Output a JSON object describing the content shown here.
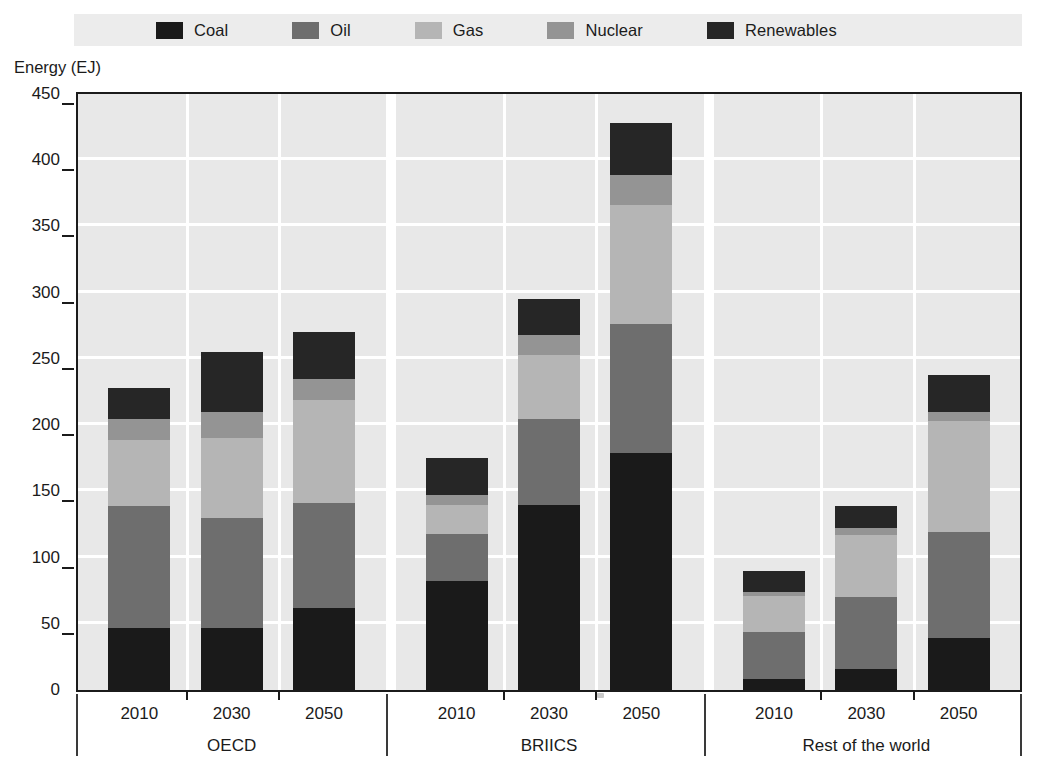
{
  "legend": {
    "position": "top",
    "items": [
      {
        "label": "Coal",
        "color": "#1a1a1a",
        "icon": "legend-swatch-icon"
      },
      {
        "label": "Oil",
        "color": "#6e6e6e",
        "icon": "legend-swatch-icon"
      },
      {
        "label": "Gas",
        "color": "#b5b5b5",
        "icon": "legend-swatch-icon"
      },
      {
        "label": "Nuclear",
        "color": "#949494",
        "icon": "legend-swatch-icon"
      },
      {
        "label": "Renewables",
        "color": "#262626",
        "icon": "legend-swatch-icon"
      }
    ]
  },
  "axes": {
    "ylabel": "Energy (EJ)",
    "yticks": [
      "0",
      "50",
      "100",
      "150",
      "200",
      "250",
      "300",
      "350",
      "400",
      "450"
    ],
    "ymin": 0,
    "ymax": 450,
    "ystep": 50
  },
  "groups": [
    {
      "name": "OECD",
      "years": [
        "2010",
        "2030",
        "2050"
      ]
    },
    {
      "name": "BRIICS",
      "years": [
        "2010",
        "2030",
        "2050"
      ]
    },
    {
      "name": "Rest of the world",
      "years": [
        "2010",
        "2030",
        "2050"
      ]
    }
  ],
  "colors": {
    "plot_background": "#e8e8e8",
    "gridline": "#ffffff",
    "legend_background": "#ececec",
    "axis": "#1b1b1b",
    "page_background": "#ffffff"
  },
  "chart_data": {
    "type": "bar",
    "subtype": "stacked",
    "title": "",
    "xlabel": "",
    "ylabel": "Energy (EJ)",
    "ylim": [
      0,
      450
    ],
    "ytick_step": 50,
    "grid": true,
    "legend_position": "top",
    "categories": [
      "OECD 2010",
      "OECD 2030",
      "OECD 2050",
      "BRIICS 2010",
      "BRIICS 2030",
      "BRIICS 2050",
      "Rest of the world 2010",
      "Rest of the world 2030",
      "Rest of the world 2050"
    ],
    "group_names": [
      "OECD",
      "BRIICS",
      "Rest of the world"
    ],
    "years": [
      "2010",
      "2030",
      "2050"
    ],
    "series": [
      {
        "name": "Coal",
        "color": "#1a1a1a",
        "values": [
          47,
          47,
          62,
          82,
          140,
          179,
          8,
          16,
          39
        ]
      },
      {
        "name": "Oil",
        "color": "#6e6e6e",
        "values": [
          92,
          83,
          79,
          36,
          65,
          97,
          36,
          54,
          80
        ]
      },
      {
        "name": "Gas",
        "color": "#b5b5b5",
        "values": [
          50,
          60,
          78,
          22,
          48,
          90,
          27,
          47,
          84
        ]
      },
      {
        "name": "Nuclear",
        "color": "#949494",
        "values": [
          16,
          20,
          16,
          7,
          15,
          23,
          3,
          5,
          7
        ]
      },
      {
        "name": "Renewables",
        "color": "#262626",
        "values": [
          23,
          45,
          35,
          28,
          27,
          39,
          16,
          17,
          28
        ]
      }
    ],
    "totals": [
      228,
      255,
      270,
      175,
      295,
      428,
      90,
      139,
      238
    ]
  }
}
